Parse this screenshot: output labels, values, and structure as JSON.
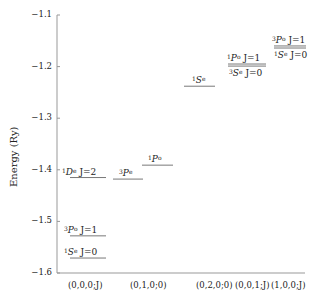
{
  "chart_data": {
    "type": "energy-level-diagram",
    "title": "",
    "xlabel": "",
    "ylabel": "Energy (Ry)",
    "ylim": [
      -1.6,
      -1.1
    ],
    "yticks": [
      "-1.1",
      "-1.2",
      "-1.3",
      "-1.4",
      "-1.5",
      "-1.6"
    ],
    "categories": [
      "(0,0,0;J)",
      "(0,1,0;0)",
      "(0,2,0;0)",
      "(0,0,1;J)",
      "(1,0,0;J)"
    ],
    "levels": [
      {
        "category": "(0,0,0;J)",
        "mult": "1",
        "L": "D",
        "parity": "e",
        "J": "J=2",
        "energy": -1.415
      },
      {
        "category": "(0,0,0;J)",
        "mult": "3",
        "L": "P",
        "parity": "o",
        "J": "J=1",
        "energy": -1.528
      },
      {
        "category": "(0,0,0;J)",
        "mult": "1",
        "L": "S",
        "parity": "e",
        "J": "J=0",
        "energy": -1.571
      },
      {
        "category": "(0,1,0;0)",
        "mult": "3",
        "L": "P",
        "parity": "e",
        "J": "",
        "energy": -1.418
      },
      {
        "category": "(0,1,0;0)",
        "mult": "1",
        "L": "P",
        "parity": "o",
        "J": "",
        "energy": -1.391
      },
      {
        "category": "(0,2,0;0)",
        "mult": "1",
        "L": "S",
        "parity": "e",
        "J": "",
        "energy": -1.238
      },
      {
        "category": "(0,0,1;J)",
        "mult": "1",
        "L": "P",
        "parity": "o",
        "J": "J=1",
        "energy": -1.195
      },
      {
        "category": "(0,0,1;J)",
        "mult": "3",
        "L": "S",
        "parity": "e",
        "J": "J=0",
        "energy": -1.199
      },
      {
        "category": "(1,0,0;J)",
        "mult": "3",
        "L": "P",
        "parity": "o",
        "J": "J=1",
        "energy": -1.16
      },
      {
        "category": "(1,0,0;J)",
        "mult": "1",
        "L": "S",
        "parity": "e",
        "J": "J=0",
        "energy": -1.164
      }
    ]
  }
}
